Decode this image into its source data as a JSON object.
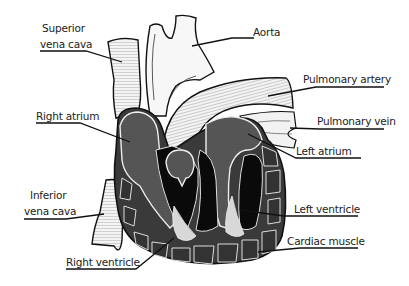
{
  "diagram": {
    "colors": {
      "outline": "#111111",
      "chamber_dark": "#555555",
      "cavity": "#0a0a0a",
      "muscle": "#3a3a3a",
      "vessel_fill": "#f4f4f4",
      "light_flow": "#d4d4d4",
      "background": "#ffffff"
    },
    "labels": {
      "superior_vena_cava_1": "Superior",
      "superior_vena_cava_2": "vena cava",
      "aorta": "Aorta",
      "pulmonary_artery": "Pulmonary artery",
      "pulmonary_vein": "Pulmonary vein",
      "right_atrium": "Right atrium",
      "left_atrium": "Left atrium",
      "inferior_vena_cava_1": "Inferior",
      "inferior_vena_cava_2": "vena cava",
      "left_ventricle": "Left ventricle",
      "cardiac_muscle": "Cardiac muscle",
      "right_ventricle": "Right ventricle"
    }
  }
}
